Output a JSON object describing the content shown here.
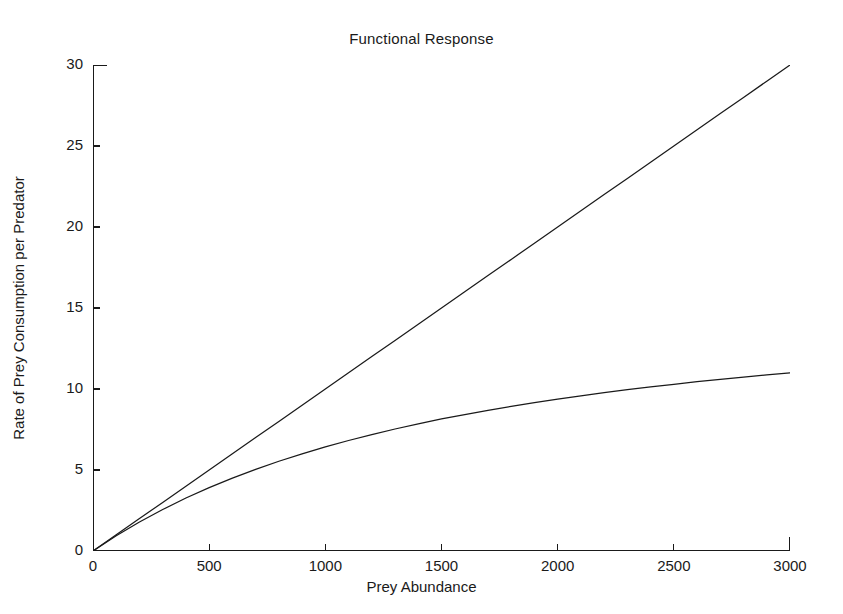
{
  "chart_data": {
    "type": "line",
    "title": "Functional Response",
    "xlabel": "Prey Abundance",
    "ylabel": "Rate of Prey Consumption per Predator",
    "xlim": [
      0,
      3000
    ],
    "ylim": [
      0,
      30
    ],
    "xticks": [
      0,
      500,
      1000,
      1500,
      2000,
      2500,
      3000
    ],
    "xticklabels": [
      "0",
      "500",
      "1000",
      "1500",
      "2000",
      "2500",
      "3000"
    ],
    "yticks": [
      0,
      5,
      10,
      15,
      20,
      25,
      30
    ],
    "yticklabels": [
      "0",
      "5",
      "10",
      "15",
      "20",
      "25",
      "30"
    ],
    "grid": false,
    "legend": "none",
    "line_color": "#1a1a1a",
    "background": "#ffffff",
    "x": [
      0,
      100,
      200,
      300,
      400,
      500,
      600,
      700,
      800,
      900,
      1000,
      1100,
      1200,
      1300,
      1400,
      1500,
      1600,
      1700,
      1800,
      1900,
      2000,
      2100,
      2200,
      2300,
      2400,
      2500,
      2600,
      2700,
      2800,
      2900,
      3000
    ],
    "series": [
      {
        "name": "Type I (linear) response",
        "values": [
          0,
          1,
          2,
          3,
          4,
          5,
          6,
          7,
          8,
          9,
          10,
          11,
          12,
          13,
          14,
          15,
          16,
          17,
          18,
          19,
          20,
          21,
          22,
          23,
          24,
          25,
          26,
          27,
          28,
          29,
          30
        ]
      },
      {
        "name": "Type II (saturating) response",
        "values": [
          0,
          0.94,
          1.79,
          2.56,
          3.27,
          3.91,
          4.5,
          5.04,
          5.54,
          6.0,
          6.43,
          6.82,
          7.19,
          7.53,
          7.85,
          8.15,
          8.42,
          8.68,
          8.93,
          9.16,
          9.38,
          9.58,
          9.77,
          9.96,
          10.13,
          10.29,
          10.45,
          10.6,
          10.74,
          10.87,
          11.0
        ]
      }
    ]
  }
}
